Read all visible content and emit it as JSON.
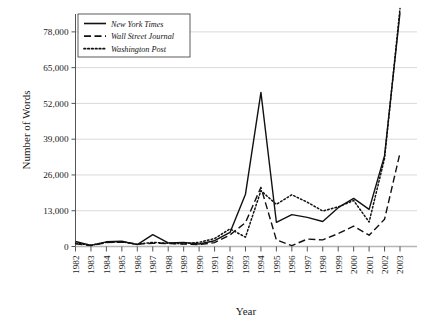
{
  "chart_data": {
    "type": "line",
    "title": "",
    "xlabel": "Year",
    "ylabel": "Number of Words",
    "grid": true,
    "legend_position": "top-left",
    "xlim": [
      1982,
      2003
    ],
    "ylim": [
      0,
      84500
    ],
    "ytick_labels": [
      "0",
      "13,000",
      "26,000",
      "39,000",
      "52,000",
      "65,000",
      "78,000"
    ],
    "ytick_values": [
      0,
      13000,
      26000,
      39000,
      52000,
      65000,
      78000
    ],
    "categories": [
      "1982",
      "1983",
      "1984",
      "1985",
      "1986",
      "1987",
      "1988",
      "1989",
      "1990",
      "1991",
      "1992",
      "1993",
      "1994",
      "1995",
      "1996",
      "1997",
      "1998",
      "1999",
      "2000",
      "2001",
      "2002",
      "2003"
    ],
    "x": [
      1982,
      1983,
      1984,
      1985,
      1986,
      1987,
      1988,
      1989,
      1990,
      1991,
      1992,
      1993,
      1994,
      1995,
      1996,
      1997,
      1998,
      1999,
      2000,
      2001,
      2002,
      2003
    ],
    "series": [
      {
        "name": "New York Times",
        "style": "solid",
        "color": "#111111",
        "values": [
          1800,
          400,
          1700,
          1900,
          700,
          4300,
          1300,
          1500,
          900,
          2100,
          5100,
          19000,
          56000,
          8800,
          11600,
          10600,
          9100,
          14100,
          17500,
          13500,
          33000,
          85000
        ]
      },
      {
        "name": "Wall Street Journal",
        "style": "dashed",
        "color": "#111111",
        "values": [
          1000,
          300,
          1400,
          1600,
          900,
          1200,
          1100,
          900,
          700,
          1400,
          4200,
          8700,
          21500,
          2400,
          300,
          2700,
          2400,
          4700,
          7400,
          4100,
          9900,
          34000
        ]
      },
      {
        "name": "Washington Post",
        "style": "dotted",
        "color": "#111111",
        "values": [
          1200,
          500,
          1500,
          1700,
          800,
          1500,
          1200,
          1000,
          1500,
          2900,
          6400,
          3400,
          20300,
          15300,
          18800,
          16100,
          12900,
          14400,
          16700,
          8900,
          32000,
          86500
        ]
      }
    ]
  },
  "axis": {
    "ylabel": "Number of Words",
    "xlabel": "Year"
  },
  "legend": {
    "items": [
      {
        "label": "New York Times"
      },
      {
        "label": "Wall Street Journal"
      },
      {
        "label": "Washington Post"
      }
    ]
  }
}
